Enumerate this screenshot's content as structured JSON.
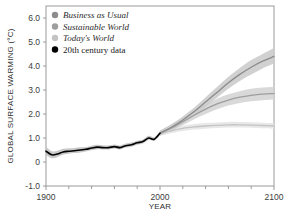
{
  "chart_data": {
    "type": "line",
    "title": "",
    "xlabel": "YEAR",
    "ylabel": "GLOBAL SURFACE WARMING (°C)",
    "xlim": [
      1900,
      2100
    ],
    "ylim": [
      -1.0,
      6.5
    ],
    "grid": false,
    "legend_position": "top-left",
    "x_ticks_major": [
      1900,
      2000,
      2100
    ],
    "x_ticks_major_labels": [
      "1900",
      "2000",
      "2100"
    ],
    "x_ticks_minor": [
      1920,
      1940,
      1960,
      1980,
      2020,
      2040,
      2060,
      2080
    ],
    "y_ticks": [
      -1.0,
      0,
      1.0,
      2.0,
      3.0,
      4.0,
      5.0,
      6.0
    ],
    "y_tick_labels": [
      "-1.0",
      "0",
      "1.0",
      "2.0",
      "3.0",
      "4.0",
      "5.0",
      "6.0"
    ],
    "series": [
      {
        "name": "Business as Usual",
        "color": "#8c8c8c",
        "band_color": "#c9c9c9",
        "x": [
          2000,
          2010,
          2020,
          2030,
          2040,
          2050,
          2060,
          2070,
          2080,
          2090,
          2100
        ],
        "values": [
          1.2,
          1.45,
          1.75,
          2.1,
          2.5,
          2.9,
          3.3,
          3.65,
          3.95,
          4.2,
          4.4
        ],
        "band_low": [
          1.1,
          1.32,
          1.6,
          1.93,
          2.3,
          2.68,
          3.05,
          3.38,
          3.65,
          3.9,
          4.1
        ],
        "band_high": [
          1.3,
          1.58,
          1.9,
          2.27,
          2.7,
          3.12,
          3.55,
          3.92,
          4.25,
          4.5,
          4.75
        ]
      },
      {
        "name": "Sustainable World",
        "color": "#9e9e9e",
        "band_color": "#d2d2d2",
        "x": [
          2000,
          2010,
          2020,
          2030,
          2040,
          2050,
          2060,
          2070,
          2080,
          2090,
          2100
        ],
        "values": [
          1.2,
          1.42,
          1.68,
          1.95,
          2.2,
          2.42,
          2.58,
          2.7,
          2.78,
          2.83,
          2.85
        ],
        "band_low": [
          1.1,
          1.3,
          1.53,
          1.78,
          2.0,
          2.2,
          2.35,
          2.46,
          2.53,
          2.57,
          2.6
        ],
        "band_high": [
          1.3,
          1.55,
          1.83,
          2.12,
          2.4,
          2.64,
          2.82,
          2.95,
          3.05,
          3.1,
          3.12
        ]
      },
      {
        "name": "Today's World",
        "color": "#c4c4c4",
        "band_color": "#e4e4e4",
        "x": [
          2000,
          2010,
          2020,
          2030,
          2040,
          2050,
          2060,
          2070,
          2080,
          2090,
          2100
        ],
        "values": [
          1.2,
          1.3,
          1.4,
          1.46,
          1.5,
          1.53,
          1.55,
          1.55,
          1.54,
          1.52,
          1.5
        ],
        "band_low": [
          1.1,
          1.2,
          1.29,
          1.35,
          1.39,
          1.42,
          1.44,
          1.44,
          1.43,
          1.41,
          1.39
        ],
        "band_high": [
          1.3,
          1.41,
          1.51,
          1.58,
          1.62,
          1.65,
          1.67,
          1.67,
          1.66,
          1.64,
          1.62
        ]
      },
      {
        "name": "20th century data",
        "color": "#000000",
        "band_color": "#bfbfbf",
        "x": [
          1900,
          1905,
          1910,
          1915,
          1920,
          1925,
          1930,
          1935,
          1940,
          1945,
          1950,
          1955,
          1960,
          1965,
          1970,
          1975,
          1980,
          1985,
          1990,
          1995,
          2000
        ],
        "values": [
          0.45,
          0.3,
          0.33,
          0.42,
          0.45,
          0.47,
          0.5,
          0.53,
          0.58,
          0.62,
          0.6,
          0.6,
          0.64,
          0.6,
          0.68,
          0.72,
          0.8,
          0.85,
          1.0,
          0.95,
          1.2
        ],
        "band_low": [
          0.28,
          0.16,
          0.2,
          0.3,
          0.34,
          0.37,
          0.4,
          0.44,
          0.49,
          0.53,
          0.52,
          0.52,
          0.56,
          0.52,
          0.6,
          0.64,
          0.72,
          0.77,
          0.92,
          0.88,
          1.12
        ],
        "band_high": [
          0.62,
          0.45,
          0.47,
          0.55,
          0.57,
          0.58,
          0.61,
          0.63,
          0.68,
          0.72,
          0.69,
          0.69,
          0.73,
          0.69,
          0.77,
          0.81,
          0.89,
          0.94,
          1.09,
          1.03,
          1.28
        ]
      }
    ]
  },
  "legend": {
    "items": [
      {
        "label": "Business as Usual",
        "color": "#8c8c8c",
        "style": "italic"
      },
      {
        "label": "Sustainable World",
        "color": "#9e9e9e",
        "style": "italic"
      },
      {
        "label": "Today's World",
        "color": "#c4c4c4",
        "style": "italic"
      },
      {
        "label": "20th century data",
        "color": "#000000",
        "style": "normal"
      }
    ]
  },
  "axes": {
    "y_title": "GLOBAL SURFACE WARMING (°C)",
    "x_title": "YEAR",
    "y_labels": [
      "6.0",
      "5.0",
      "4.0",
      "3.0",
      "2.0",
      "1.0",
      "0",
      "-1.0"
    ],
    "x_labels": [
      "1900",
      "2000",
      "2100"
    ]
  }
}
